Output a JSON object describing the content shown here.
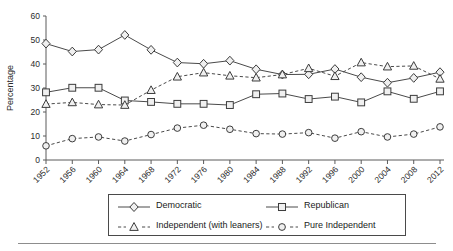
{
  "chart_data": {
    "type": "line",
    "title": "",
    "subtitle": "",
    "xlabel": "",
    "ylabel": "Percentage",
    "xlim": [
      1952,
      2012
    ],
    "ylim": [
      0,
      60
    ],
    "ytick_step": 10,
    "yticks": [
      0,
      10,
      20,
      30,
      40,
      50,
      60
    ],
    "grid": false,
    "legend_position": "bottom",
    "categories": [
      "1952",
      "1956",
      "1960",
      "1964",
      "1968",
      "1972",
      "1976",
      "1980",
      "1984",
      "1988",
      "1992",
      "1996",
      "2000",
      "2004",
      "2008",
      "2012"
    ],
    "series": [
      {
        "name": "Democratic",
        "marker": "diamond",
        "linestyle": "solid",
        "values": [
          48.5,
          45.2,
          46.0,
          52.1,
          45.9,
          40.6,
          40.1,
          41.4,
          37.8,
          35.6,
          35.7,
          37.9,
          34.5,
          32.2,
          34.2,
          36.6
        ]
      },
      {
        "name": "Republican",
        "marker": "square",
        "linestyle": "solid",
        "values": [
          28.2,
          30.1,
          30.1,
          24.8,
          24.2,
          23.4,
          23.4,
          22.9,
          27.4,
          27.7,
          25.4,
          26.4,
          24.0,
          28.6,
          25.5,
          28.6
        ]
      },
      {
        "name": "Independent (with leaners)",
        "marker": "triangle",
        "linestyle": "dashed",
        "values": [
          23.3,
          24.0,
          23.1,
          22.9,
          29.1,
          34.7,
          36.4,
          35.1,
          34.3,
          35.6,
          38.2,
          34.9,
          40.6,
          38.9,
          39.2,
          33.8
        ]
      },
      {
        "name": "Pure Independent",
        "marker": "circle",
        "linestyle": "dashed",
        "values": [
          5.9,
          8.9,
          9.6,
          7.9,
          10.6,
          13.3,
          14.5,
          12.8,
          11.0,
          10.8,
          11.4,
          9.1,
          11.8,
          9.6,
          10.8,
          13.8
        ]
      }
    ],
    "colors": {
      "line": "#4a4a4a",
      "marker_fill": "#f0f0f0",
      "marker_stroke": "#3c3c3c",
      "axis": "#5a5a5a",
      "text": "#1a1a1a"
    }
  },
  "legend": {
    "items": [
      {
        "label": "Democratic",
        "marker": "diamond",
        "linestyle": "solid"
      },
      {
        "label": "Republican",
        "marker": "square",
        "linestyle": "solid"
      },
      {
        "label": "Independent (with leaners)",
        "marker": "triangle",
        "linestyle": "dashed"
      },
      {
        "label": "Pure Independent",
        "marker": "circle",
        "linestyle": "dashed"
      }
    ]
  }
}
